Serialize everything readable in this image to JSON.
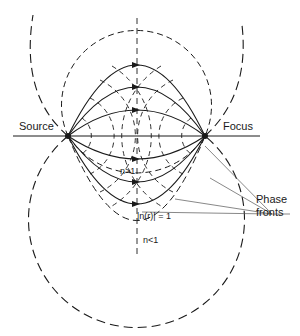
{
  "diagram": {
    "labels": {
      "source": "Source",
      "focus": "Focus",
      "n_greater": "n>1",
      "n_equal": "|n(r)| = 1",
      "n_less": "n<1",
      "phase_fronts_line1": "Phase",
      "phase_fronts_line2": "fronts"
    },
    "points": {
      "source": {
        "x": 68,
        "y": 136
      },
      "focus": {
        "x": 205,
        "y": 136
      }
    },
    "rays": {
      "style": "solid with arrowheads",
      "upper_apex_y": [
        65,
        87,
        110
      ],
      "lower_apex_y": [
        159,
        182,
        204
      ]
    },
    "phase_fronts": {
      "style": "dashed circles around source and focus"
    },
    "boundaries": {
      "unit_index_circle_style": "dashed",
      "outer_circle_style": "long-dashed"
    },
    "colors": {
      "ink": "#1a1a1a",
      "background": "#ffffff"
    }
  }
}
